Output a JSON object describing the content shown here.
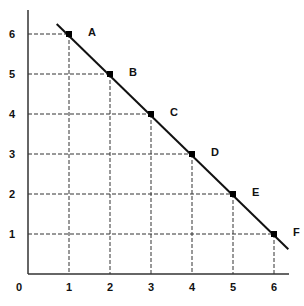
{
  "chart_data": {
    "type": "line",
    "title": "",
    "xlabel": "",
    "ylabel": "",
    "xlim": [
      0,
      6.35
    ],
    "ylim": [
      0,
      6.6
    ],
    "grid": "dashed guide lines from each point to both axes",
    "legend": null,
    "x_ticks": [
      "0",
      "1",
      "2",
      "3",
      "4",
      "5",
      "6"
    ],
    "y_ticks": [
      "1",
      "2",
      "3",
      "4",
      "5",
      "6"
    ],
    "series": [
      {
        "name": "line",
        "points": [
          {
            "label": "A",
            "x": 1,
            "y": 6
          },
          {
            "label": "B",
            "x": 2,
            "y": 5
          },
          {
            "label": "C",
            "x": 3,
            "y": 4
          },
          {
            "label": "D",
            "x": 4,
            "y": 3
          },
          {
            "label": "E",
            "x": 5,
            "y": 2
          },
          {
            "label": "F",
            "x": 6,
            "y": 1
          }
        ],
        "line_extent": {
          "x_start": 0.7,
          "y_start": 6.25,
          "x_end": 6.35,
          "y_end": 0.62
        }
      }
    ]
  },
  "colors": {
    "axis": "#333333",
    "line": "#111111",
    "guide": "#333333",
    "point": "#000000",
    "background": "#ffffff"
  }
}
